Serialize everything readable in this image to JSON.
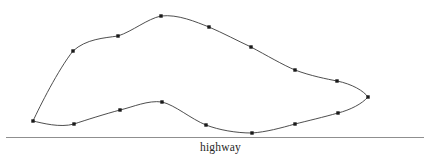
{
  "figure": {
    "width": 441,
    "height": 164,
    "background_color": "#ffffff",
    "type": "parcel-boundary-sketch",
    "stroke_color": "#3a3a3a",
    "vertex_color": "#1a1a1a",
    "highway_line_color": "#8f8f8f"
  },
  "highway": {
    "label": "highway",
    "line": {
      "x1": 6,
      "y1": 137.5,
      "x2": 424,
      "y2": 137.5
    }
  },
  "parcel": {
    "name": "parcel-outline",
    "closed": true,
    "boundary_points": [
      {
        "x": 33,
        "y": 121
      },
      {
        "x": 73,
        "y": 51
      },
      {
        "x": 118,
        "y": 36
      },
      {
        "x": 161,
        "y": 16
      },
      {
        "x": 209,
        "y": 27
      },
      {
        "x": 251,
        "y": 47
      },
      {
        "x": 295,
        "y": 70
      },
      {
        "x": 337,
        "y": 81
      },
      {
        "x": 368,
        "y": 97
      },
      {
        "x": 338,
        "y": 113
      },
      {
        "x": 295,
        "y": 124
      },
      {
        "x": 252,
        "y": 133
      },
      {
        "x": 206,
        "y": 125
      },
      {
        "x": 162,
        "y": 102
      },
      {
        "x": 120,
        "y": 110
      },
      {
        "x": 74,
        "y": 124
      }
    ],
    "vertex_marker_size": 3.4,
    "upper_boundary_path": "M 33,121 C 40,106 58,70 73,51 C 86,39 104,38 118,36 C 133,31 147,19 161,16 C 178,14 196,22 209,27 C 223,33 238,41 251,47 C 266,55 283,65 295,70 C 311,76 327,79 337,81 C 352,84 364,91 368,97",
    "lower_boundary_path": "M 368,97 C 362,104 350,110 338,113 C 324,117 307,121 295,124 C 281,128 266,132 252,133 C 236,133 219,130 206,125 C 191,119 175,105 162,102 C 148,100 133,107 120,110 C 105,114 86,120 74,124 C 60,128 42,123 33,121",
    "vertex_count": 16
  },
  "chart_data": {
    "type": "scatter",
    "title": "",
    "xlabel": "",
    "ylabel": "",
    "annotations": [
      "highway"
    ],
    "series": [
      {
        "name": "parcel-boundary-vertices",
        "x": [
          33,
          73,
          118,
          161,
          209,
          251,
          295,
          337,
          368,
          338,
          295,
          252,
          206,
          162,
          120,
          74
        ],
        "y": [
          121,
          51,
          36,
          16,
          27,
          47,
          70,
          81,
          97,
          113,
          124,
          133,
          125,
          102,
          110,
          124
        ]
      }
    ]
  }
}
